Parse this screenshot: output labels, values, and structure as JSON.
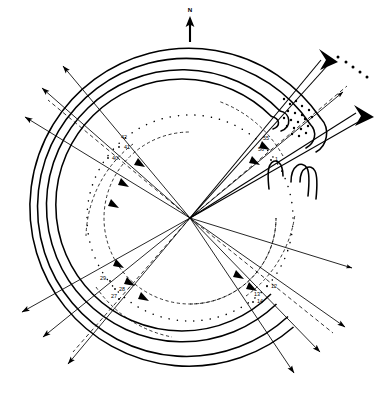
{
  "figure": {
    "north_label": "N",
    "center": {
      "x": 190,
      "y": 218
    },
    "background_color": "#ffffff",
    "ink_color": "#000000"
  },
  "labels": [
    {
      "id": "lbl-42",
      "text": "42",
      "x": 121,
      "y": 139
    },
    {
      "id": "lbl-41",
      "text": "41",
      "x": 124,
      "y": 149
    },
    {
      "id": "lbl-40",
      "text": "40",
      "x": 112,
      "y": 160
    },
    {
      "id": "lbl-29",
      "text": "29",
      "x": 100,
      "y": 280
    },
    {
      "id": "lbl-28",
      "text": "28",
      "x": 119,
      "y": 291
    },
    {
      "id": "lbl-27",
      "text": "27",
      "x": 111,
      "y": 298
    },
    {
      "id": "lbl-12",
      "text": "12",
      "x": 271,
      "y": 288
    },
    {
      "id": "lbl-13",
      "text": "13",
      "x": 254,
      "y": 296
    },
    {
      "id": "lbl-14",
      "text": "14",
      "x": 257,
      "y": 303
    },
    {
      "id": "lbl-55",
      "text": "55",
      "x": 263,
      "y": 140
    },
    {
      "id": "lbl-56",
      "text": "56",
      "x": 258,
      "y": 151
    },
    {
      "id": "lbl-1",
      "text": "1",
      "x": 275,
      "y": 161
    }
  ],
  "rings": [
    {
      "id": "ring-outer-1",
      "radius": 159,
      "weight": "heavy"
    },
    {
      "id": "ring-outer-2",
      "radius": 149,
      "weight": "heavy"
    },
    {
      "id": "ring-mid-1",
      "radius": 136,
      "weight": "heavy"
    },
    {
      "id": "ring-mid-2",
      "radius": 126,
      "weight": "heavy"
    },
    {
      "id": "ring-stipple",
      "radius": 103,
      "weight": "stipple"
    },
    {
      "id": "ring-dashed",
      "radius": 86,
      "weight": "dashed"
    }
  ],
  "rays": {
    "count": 16,
    "description": "Radial rays emanating from center hub, terminating in arrowheads"
  },
  "exit_arrows": [
    {
      "id": "exit-arrow-upper",
      "direction": "upper-right",
      "style": "large-solid"
    },
    {
      "id": "exit-arrow-lower",
      "direction": "right",
      "style": "large-solid"
    }
  ],
  "stipple_trails": [
    {
      "id": "stipple-trail-upper",
      "direction": "upper-right"
    },
    {
      "id": "stipple-trail-cluster",
      "direction": "right-center"
    }
  ]
}
